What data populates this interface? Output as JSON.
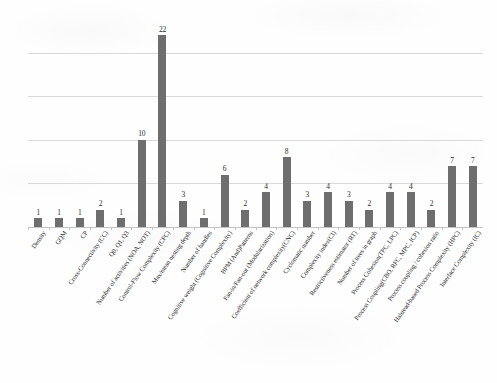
{
  "chart_data": {
    "type": "bar",
    "title": "",
    "subtitle": "",
    "xlabel": "",
    "ylabel": "",
    "ylim": [
      0,
      24
    ],
    "grid": true,
    "gridlines": [
      5,
      10,
      15,
      20
    ],
    "legend": "none",
    "bar_color": "#6e6e6e",
    "gridline_color": "#d9d9d9",
    "axis_color": "#c4c4c4",
    "show_value_labels": true,
    "categories": [
      "Density",
      "GQM",
      "CP",
      "Cross-Connectivity (CC)",
      "Q0, Q1, Q3",
      "Number of activities (NOA, NOT)",
      "Control-Flow Complexity (CFC)",
      "Max/mean nesting depth",
      "Number of handles",
      "Cognitive weight (Cognitive Complexity)",
      "BPM (And)Patterns",
      "Fan-in/Fan-out (Modularization)",
      "Coefficient of network complexity(CNC)",
      "Cyclomatic number",
      "Complexity index(CI)",
      "Restrictiveness estimator (RT)",
      "Number of trees in graph",
      "Process Cohesion(TPC, LPC)",
      "Process Coupling(CBO, RFC, MPC, ICP)",
      "Process coupling / cohesion ratio",
      "Halstead-based Process Complexity (HPC)",
      "Interface Complexity (IC)"
    ],
    "values": [
      1,
      1,
      1,
      2,
      1,
      10,
      22,
      3,
      1,
      6,
      2,
      4,
      8,
      3,
      4,
      3,
      2,
      4,
      4,
      2,
      7,
      7
    ]
  }
}
